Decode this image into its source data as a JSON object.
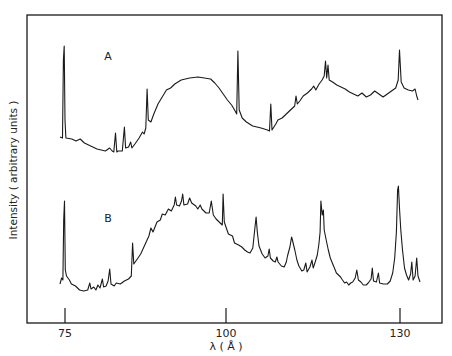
{
  "chart_data": {
    "type": "line",
    "title": "",
    "xlabel": "λ (Å)",
    "ylabel": "Intensity ( arbitrary units )",
    "xlim": [
      69,
      137
    ],
    "x_ticks": [
      75,
      100,
      130
    ],
    "y_ticks": [],
    "grid": false,
    "legend": "none",
    "annotations": [
      "A",
      "B"
    ],
    "series": [
      {
        "name": "A",
        "points": [
          [
            74.2,
            137
          ],
          [
            74.8,
            138
          ],
          [
            75.0,
            60
          ],
          [
            75.2,
            46
          ],
          [
            75.4,
            120
          ],
          [
            75.6,
            138
          ],
          [
            77,
            139
          ],
          [
            78,
            141
          ],
          [
            79,
            139
          ],
          [
            80,
            143
          ],
          [
            81,
            145
          ],
          [
            82,
            147
          ],
          [
            83,
            149
          ],
          [
            84,
            150
          ],
          [
            85,
            151
          ],
          [
            86,
            148
          ],
          [
            86.6,
            151
          ],
          [
            87,
            152
          ],
          [
            87.4,
            133
          ],
          [
            87.7,
            152
          ],
          [
            88,
            151
          ],
          [
            89,
            151
          ],
          [
            89.5,
            127
          ],
          [
            89.8,
            148
          ],
          [
            90.5,
            147
          ],
          [
            91,
            142
          ],
          [
            91.3,
            148
          ],
          [
            92,
            144
          ],
          [
            93,
            138
          ],
          [
            93.8,
            132
          ],
          [
            94.2,
            134
          ],
          [
            94.6,
            128
          ],
          [
            94.9,
            89
          ],
          [
            95.2,
            120
          ],
          [
            95.8,
            122
          ],
          [
            96.5,
            114
          ],
          [
            97.5,
            104
          ],
          [
            98.5,
            97
          ],
          [
            99.5,
            90
          ],
          [
            100.5,
            88
          ],
          [
            101.5,
            84
          ],
          [
            103,
            80
          ],
          [
            105,
            78
          ],
          [
            107,
            77
          ],
          [
            108.5,
            78
          ],
          [
            110,
            79
          ],
          [
            111,
            83
          ],
          [
            112,
            88
          ],
          [
            113,
            94
          ],
          [
            114,
            100
          ],
          [
            115,
            105
          ],
          [
            115.7,
            110
          ],
          [
            116.2,
            114
          ],
          [
            116.5,
            51
          ],
          [
            116.8,
            110
          ],
          [
            117.5,
            118
          ],
          [
            118.5,
            122
          ],
          [
            120,
            126
          ],
          [
            122,
            128
          ],
          [
            123.5,
            130
          ],
          [
            124,
            131
          ],
          [
            124.3,
            104
          ],
          [
            124.6,
            130
          ],
          [
            125.5,
            124
          ],
          [
            126,
            120
          ],
          [
            127,
            118
          ],
          [
            128,
            114
          ],
          [
            129,
            110
          ],
          [
            130,
            106
          ],
          [
            130.3,
            96
          ],
          [
            130.6,
            104
          ],
          [
            131.2,
            101
          ],
          [
            132,
            96
          ],
          [
            133,
            93
          ],
          [
            134,
            89
          ],
          [
            134.5,
            86
          ],
          [
            135,
            90
          ],
          [
            135.8,
            84
          ],
          [
            136.5,
            80
          ],
          [
            137,
            76
          ],
          [
            137.3,
            61
          ],
          [
            137.6,
            78
          ],
          [
            137.9,
            65
          ],
          [
            138.2,
            80
          ],
          [
            139,
            82
          ],
          [
            140,
            85
          ],
          [
            141,
            87
          ],
          [
            142,
            89
          ],
          [
            143,
            92
          ],
          [
            144,
            94
          ],
          [
            145,
            96
          ],
          [
            146,
            93
          ],
          [
            147,
            97
          ],
          [
            148,
            95
          ],
          [
            149,
            91
          ],
          [
            150,
            94
          ],
          [
            151,
            97
          ],
          [
            152,
            94
          ],
          [
            153,
            91
          ],
          [
            154,
            88
          ],
          [
            154.6,
            80
          ],
          [
            154.9,
            50
          ],
          [
            155.3,
            82
          ],
          [
            156,
            88
          ],
          [
            157,
            90
          ],
          [
            158,
            91
          ],
          [
            158.6,
            89
          ],
          [
            159,
            96
          ],
          [
            159.3,
            100
          ]
        ]
      },
      {
        "name": "B",
        "points": [
          [
            74.2,
            284
          ],
          [
            74.6,
            278
          ],
          [
            74.9,
            280
          ],
          [
            75.1,
            220
          ],
          [
            75.3,
            201
          ],
          [
            75.5,
            270
          ],
          [
            75.8,
            276
          ],
          [
            76.5,
            280
          ],
          [
            77,
            284
          ],
          [
            78,
            286
          ],
          [
            79,
            290
          ],
          [
            80,
            291
          ],
          [
            81,
            290
          ],
          [
            81.5,
            283
          ],
          [
            81.8,
            289
          ],
          [
            82.5,
            287
          ],
          [
            83,
            290
          ],
          [
            83.5,
            285
          ],
          [
            84,
            288
          ],
          [
            84.6,
            279
          ],
          [
            84.9,
            287
          ],
          [
            85.5,
            286
          ],
          [
            86,
            281
          ],
          [
            86.4,
            269
          ],
          [
            86.7,
            284
          ],
          [
            87.5,
            286
          ],
          [
            88,
            283
          ],
          [
            89,
            284
          ],
          [
            90,
            281
          ],
          [
            91,
            279
          ],
          [
            91.7,
            276
          ],
          [
            92,
            243
          ],
          [
            92.3,
            264
          ],
          [
            93,
            260
          ],
          [
            94,
            254
          ],
          [
            95,
            245
          ],
          [
            96,
            236
          ],
          [
            96.5,
            228
          ],
          [
            97,
            232
          ],
          [
            98,
            222
          ],
          [
            98.8,
            220
          ],
          [
            99.3,
            214
          ],
          [
            100,
            215
          ],
          [
            100.8,
            209
          ],
          [
            101.5,
            211
          ],
          [
            102.2,
            205
          ],
          [
            102.5,
            197
          ],
          [
            102.8,
            205
          ],
          [
            103.5,
            206
          ],
          [
            104,
            201
          ],
          [
            104.3,
            194
          ],
          [
            104.6,
            205
          ],
          [
            105.5,
            204
          ],
          [
            106,
            198
          ],
          [
            106.5,
            203
          ],
          [
            107.5,
            206
          ],
          [
            108,
            209
          ],
          [
            108.6,
            205
          ],
          [
            109,
            209
          ],
          [
            110,
            213
          ],
          [
            110.8,
            213
          ],
          [
            111.3,
            201
          ],
          [
            111.8,
            215
          ],
          [
            112.5,
            219
          ],
          [
            113.5,
            223
          ],
          [
            114,
            225
          ],
          [
            114.2,
            194
          ],
          [
            114.5,
            222
          ],
          [
            115,
            228
          ],
          [
            115.5,
            234
          ],
          [
            116.5,
            236
          ],
          [
            117,
            243
          ],
          [
            118,
            245
          ],
          [
            118.8,
            247
          ],
          [
            119.5,
            250
          ],
          [
            120.2,
            252
          ],
          [
            120.8,
            253
          ],
          [
            121.5,
            248
          ],
          [
            122,
            228
          ],
          [
            122.3,
            217
          ],
          [
            122.6,
            232
          ],
          [
            123,
            246
          ],
          [
            123.8,
            254
          ],
          [
            124.5,
            258
          ],
          [
            125.2,
            256
          ],
          [
            125.5,
            249
          ],
          [
            125.8,
            258
          ],
          [
            126.5,
            261
          ],
          [
            127,
            262
          ],
          [
            127.4,
            257
          ],
          [
            127.7,
            262
          ],
          [
            128.5,
            266
          ],
          [
            129.2,
            267
          ],
          [
            129.7,
            262
          ],
          [
            130,
            256
          ],
          [
            130.6,
            247
          ],
          [
            131,
            237
          ],
          [
            131.2,
            240
          ],
          [
            131.8,
            250
          ],
          [
            132.3,
            260
          ],
          [
            132.8,
            266
          ],
          [
            133.5,
            271
          ],
          [
            134,
            270
          ],
          [
            134.5,
            263
          ],
          [
            134.8,
            272
          ],
          [
            135.5,
            267
          ],
          [
            136,
            260
          ],
          [
            136.3,
            268
          ],
          [
            136.8,
            262
          ],
          [
            137.3,
            255
          ],
          [
            137.7,
            244
          ],
          [
            138,
            232
          ],
          [
            138.2,
            201
          ],
          [
            138.5,
            215
          ],
          [
            138.8,
            210
          ],
          [
            139,
            230
          ],
          [
            139.5,
            240
          ],
          [
            140,
            250
          ],
          [
            140.5,
            258
          ],
          [
            141,
            263
          ],
          [
            141.5,
            268
          ],
          [
            142,
            273
          ],
          [
            142.5,
            275
          ],
          [
            143,
            277
          ],
          [
            143.5,
            280
          ],
          [
            144,
            283
          ],
          [
            144.5,
            282
          ],
          [
            145,
            285
          ],
          [
            145.5,
            283
          ],
          [
            146,
            282
          ],
          [
            146.6,
            278
          ],
          [
            147,
            270
          ],
          [
            147.4,
            280
          ],
          [
            148,
            282
          ],
          [
            148.6,
            285
          ],
          [
            149.3,
            285
          ],
          [
            149.8,
            283
          ],
          [
            150.5,
            279
          ],
          [
            150.8,
            268
          ],
          [
            151.1,
            281
          ],
          [
            151.8,
            282
          ],
          [
            152.3,
            273
          ],
          [
            152.6,
            283
          ],
          [
            153.5,
            284
          ],
          [
            154.5,
            284
          ],
          [
            155.2,
            281
          ],
          [
            155.8,
            273
          ],
          [
            156.3,
            258
          ],
          [
            156.7,
            232
          ],
          [
            157,
            190
          ],
          [
            157.2,
            186
          ],
          [
            157.5,
            210
          ],
          [
            157.8,
            230
          ],
          [
            158.2,
            250
          ],
          [
            158.7,
            268
          ],
          [
            159.2,
            275
          ],
          [
            159.7,
            280
          ],
          [
            160.2,
            274
          ],
          [
            160.5,
            262
          ],
          [
            160.8,
            280
          ],
          [
            161.3,
            276
          ],
          [
            161.7,
            258
          ],
          [
            162,
            276
          ],
          [
            162.5,
            282
          ]
        ]
      }
    ],
    "axis_pixels": {
      "frame": {
        "left": 27,
        "top": 15,
        "right": 442,
        "bottom": 323
      },
      "ticks_px": {
        "75": 65,
        "100": 226,
        "130": 400
      }
    }
  },
  "labels": {
    "xlabel": "λ ( Å )",
    "ylabel": "Intensity ( arbitrary units )",
    "series_a": "A",
    "series_b": "B",
    "tick_75": "75",
    "tick_100": "100",
    "tick_130": "130"
  }
}
